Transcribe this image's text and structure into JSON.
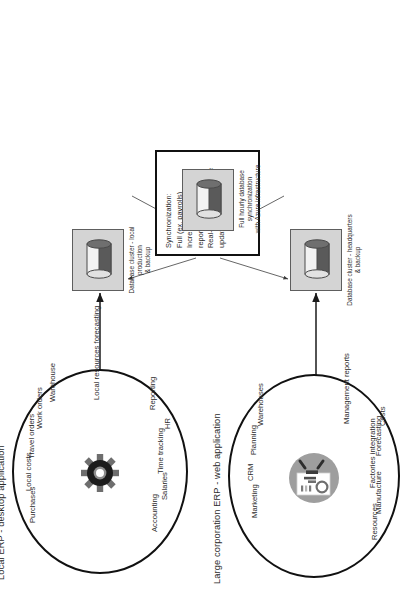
{
  "diagram": {
    "orientation": "rotated-90-ccw",
    "colors": {
      "stroke": "#111111",
      "text": "#2b2b2b",
      "db_box_fill": "#d4d4d4",
      "db_box_stroke": "#5e5e5e",
      "cylinder_top": "#f2f2f2",
      "cylinder_bottom": "#5a5a5a",
      "gear_dark": "#1c1c1c",
      "gear_mid": "#6e6e6e",
      "web_icon_circle": "#9e9e9e"
    }
  },
  "domains": [
    {
      "id": "local-erp",
      "title": "Local ERP - desktop application",
      "icon": "gear-icon",
      "features": [
        "Purchases",
        "Local costs",
        "Travel orders",
        "Work orders",
        "Warehouse",
        "Local resources forecasting",
        "Accounting",
        "Salaries",
        "Time tracking",
        "HR",
        "Reporting"
      ]
    },
    {
      "id": "corp-erp",
      "title": "Large corporation ERP - web application",
      "icon": "report-chart-icon",
      "features": [
        "Marketing",
        "CRM",
        "Planning",
        "Warehouses",
        "Management reports",
        "Resources",
        "Manufacture",
        "Factories integration",
        "Forecasting",
        "Costs"
      ]
    }
  ],
  "clusters": [
    {
      "id": "cluster-local",
      "icon": "database-cylinder-icon",
      "caption": "Database cluster - local production\n& backup"
    },
    {
      "id": "cluster-azure",
      "icon": "database-cylinder-icon",
      "caption": "Full hourly database synchronization\nwith Azure infrastructure"
    },
    {
      "id": "cluster-hq",
      "icon": "database-cylinder-icon",
      "caption": "Database cluster - headquarters\n& backup"
    }
  ],
  "sync_box": {
    "id": "synchronization-box",
    "text": "Synchronization:\nFull (ex. payrolls)\nIncremental (ex. daily reports)\nReal-time (ex. employee updates)"
  }
}
